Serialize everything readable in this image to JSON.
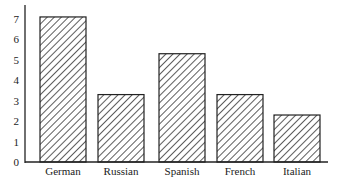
{
  "chart_data": {
    "type": "bar",
    "title": "",
    "xlabel": "",
    "ylabel": "",
    "categories": [
      "German",
      "Russian",
      "Spanish",
      "French",
      "Italian"
    ],
    "values": [
      7.1,
      3.3,
      5.3,
      3.3,
      2.3
    ],
    "ylim": [
      0,
      7.5
    ],
    "yticks": [
      0,
      1,
      2,
      3,
      4,
      5,
      6,
      7
    ],
    "grid": false,
    "legend": null,
    "bar_style": "diagonal-hatch",
    "colors": {
      "stroke": "#222222",
      "hatch": "#333333",
      "fill": "#ffffff"
    }
  }
}
